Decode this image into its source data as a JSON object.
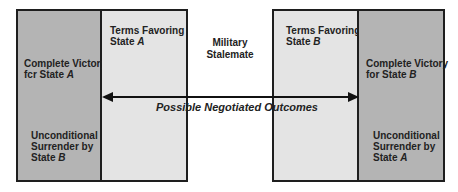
{
  "diagram": {
    "type": "spectrum-of-war-outcomes",
    "left_box": {
      "outer_panel": {
        "victory_line1": "Complete Victory",
        "victory_line2_prefix": "fcr State ",
        "victory_line2_state": "A",
        "surrender_line1": "Unconditional",
        "surrender_line2": "Surrender by",
        "surrender_line3_prefix": "State ",
        "surrender_line3_state": "B",
        "fill_color": "#b4b4b4"
      },
      "inner_panel": {
        "terms_line1": "Terms Favoring",
        "terms_line2_prefix": "State ",
        "terms_line2_state": "A",
        "fill_color": "#e4e4e4"
      }
    },
    "center": {
      "line1": "Military",
      "line2": "Stalemate"
    },
    "arrow": {
      "label": "Possible Negotiated Outcomes",
      "direction": "bidirectional"
    },
    "right_box": {
      "inner_panel": {
        "terms_line1": "Terms Favoring",
        "terms_line2_prefix": "State ",
        "terms_line2_state": "B",
        "fill_color": "#e4e4e4"
      },
      "outer_panel": {
        "victory_line1": "Complete Victory",
        "victory_line2_prefix": "for State ",
        "victory_line2_state": "B",
        "surrender_line1": "Unconditional",
        "surrender_line2": "Surrender by",
        "surrender_line3_prefix": "State ",
        "surrender_line3_state": "A",
        "fill_color": "#b4b4b4"
      }
    }
  }
}
